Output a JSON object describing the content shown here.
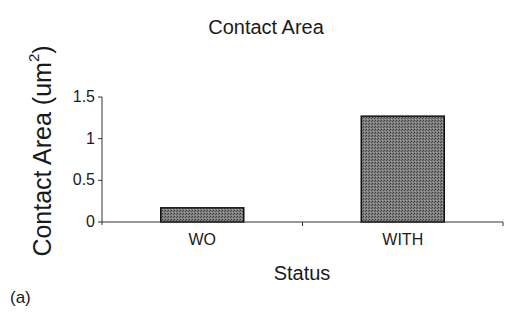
{
  "chart_data": {
    "type": "bar",
    "title": "Contact Area",
    "xlabel": "Status",
    "ylabel": "Contact Area (um²)",
    "ylabel_base": "Contact Area",
    "ylabel_unit_prefix": "(um",
    "ylabel_unit_sup": "2",
    "ylabel_unit_suffix": ")",
    "categories": [
      "WO",
      "WITH"
    ],
    "values": [
      0.17,
      1.27
    ],
    "ylim": [
      0,
      1.5
    ],
    "yticks": [
      "0",
      "0.5",
      "1",
      "1.5"
    ],
    "grid": false,
    "legend": null,
    "bar_color": "#6e6e6e",
    "bar_edge_color": "#111111",
    "panel_label": "(a)"
  }
}
